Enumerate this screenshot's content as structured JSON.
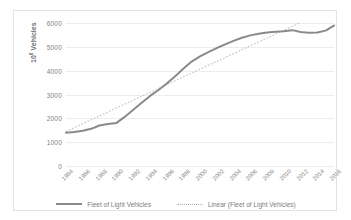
{
  "chart_data": {
    "type": "line",
    "title": "",
    "xlabel": "",
    "ylabel": "10⁶ Vehicles",
    "ylabel_base": "10",
    "ylabel_exp": "6",
    "ylabel_unit": " Vehicles",
    "ylim": [
      0,
      6000
    ],
    "ytick_labels": [
      "6000",
      "5000",
      "4000",
      "3000",
      "2000",
      "1000",
      "0"
    ],
    "ytick_values": [
      6000,
      5000,
      4000,
      3000,
      2000,
      1000,
      0
    ],
    "grid": true,
    "grid_axis": "y",
    "legend_position": "bottom",
    "categories": [
      "1984",
      "1985",
      "1986",
      "1987",
      "1988",
      "1989",
      "1990",
      "1991",
      "1992",
      "1993",
      "1994",
      "1995",
      "1996",
      "1997",
      "1998",
      "1999",
      "2000",
      "2001",
      "2002",
      "2003",
      "2004",
      "2005",
      "2006",
      "2007",
      "2008",
      "2009",
      "2010",
      "2011",
      "2012",
      "2013",
      "2014",
      "2015",
      "2016"
    ],
    "xtick_labels": [
      "1984",
      "1986",
      "1988",
      "1990",
      "1992",
      "1994",
      "1996",
      "1998",
      "2000",
      "2002",
      "2004",
      "2006",
      "2008",
      "2010",
      "2012",
      "2014",
      "2016"
    ],
    "series": [
      {
        "name": "Fleet of Light Vehicles",
        "style": "solid",
        "color": "#8a8a8a",
        "values": [
          1400,
          1430,
          1480,
          1560,
          1700,
          1760,
          1800,
          2060,
          2350,
          2640,
          2930,
          3180,
          3450,
          3760,
          4080,
          4380,
          4600,
          4780,
          4950,
          5100,
          5250,
          5380,
          5480,
          5550,
          5600,
          5630,
          5650,
          5700,
          5620,
          5590,
          5600,
          5680,
          5890
        ]
      },
      {
        "name": "Linear (Fleet of Light Vehicles)",
        "style": "dotted",
        "color": "#b3b3b3",
        "trend_start_year": "1984",
        "trend_end_year": "2012",
        "trend_start_value": 1450,
        "trend_end_value": 6020
      }
    ],
    "legend": [
      {
        "label": "Fleet of Light Vehicles",
        "style": "solid",
        "color": "#8a8a8a"
      },
      {
        "label": "Linear (Fleet of Light Vehicles)",
        "style": "dotted",
        "color": "#b3b3b3"
      }
    ]
  }
}
